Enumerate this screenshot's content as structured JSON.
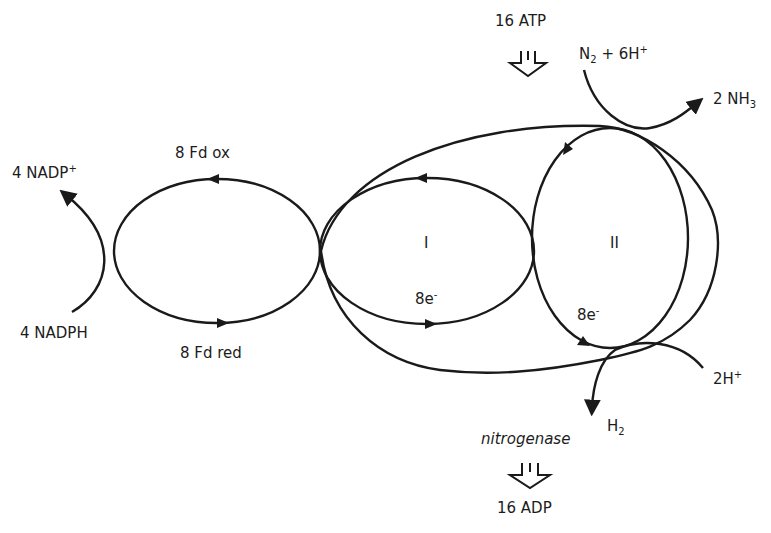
{
  "diagram": {
    "colors": {
      "stroke": "#1a1a1a",
      "background": "#ffffff"
    },
    "labels": {
      "atp": "16 ATP",
      "adp": "16 ADP",
      "n2_main": "N",
      "n2_sub": "2",
      "n2_plus": " + 6H",
      "n2_sup": "+",
      "nh3_main": "2 NH",
      "nh3_sub": "3",
      "nadp_main": "4 NADP",
      "nadp_sup": "+",
      "nadph": "4 NADPH",
      "fd_ox": "8 Fd ox",
      "fd_red": "8 Fd red",
      "component_1": "I",
      "component_2": "II",
      "electrons_1_main": "8e",
      "electrons_1_sup": "-",
      "electrons_2_main": "8e",
      "electrons_2_sup": "-",
      "h_main": "2H",
      "h_sup": "+",
      "h2_main": "H",
      "h2_sub": "2",
      "enzyme": "nitrogenase"
    },
    "nodes": [
      {
        "id": "ferredoxin-cycle",
        "label": "8 Fd ox / 8 Fd red"
      },
      {
        "id": "component-I",
        "label": "I"
      },
      {
        "id": "component-II",
        "label": "II"
      }
    ],
    "edges": [
      {
        "from": "4 NADPH",
        "to": "4 NADP+"
      },
      {
        "from": "N2 + 6H+",
        "to": "2 NH3"
      },
      {
        "from": "2H+",
        "to": "H2"
      },
      {
        "from": "16 ATP",
        "to": "16 ADP"
      }
    ]
  }
}
